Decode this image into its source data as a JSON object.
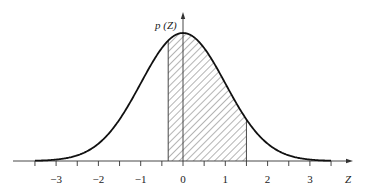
{
  "chart_data": {
    "type": "area",
    "title": "",
    "xlabel": "Z",
    "ylabel": "p (Z)",
    "function": "standard normal density",
    "x_range": [
      -3.5,
      3.5
    ],
    "xlim": [
      -4.0,
      4.0
    ],
    "x_ticks_major": [
      -3,
      -2,
      -1,
      0,
      1,
      2,
      3
    ],
    "x_tick_labels": [
      "−3",
      "−2",
      "−1",
      "0",
      "1",
      "2",
      "3"
    ],
    "x_ticks_minor": [
      -3.5,
      -2.5,
      -1.5,
      -0.5,
      0.5,
      1.5,
      2.5,
      3.5
    ],
    "shaded_region": {
      "from": -0.35,
      "to": 1.5,
      "pattern": "diagonal-hatch"
    },
    "peak": {
      "x": 0,
      "y": 0.3989
    },
    "grid": false,
    "legend": null,
    "colors": {
      "curve": "#111111",
      "axis": "#333333",
      "hatch": "#444444"
    }
  }
}
